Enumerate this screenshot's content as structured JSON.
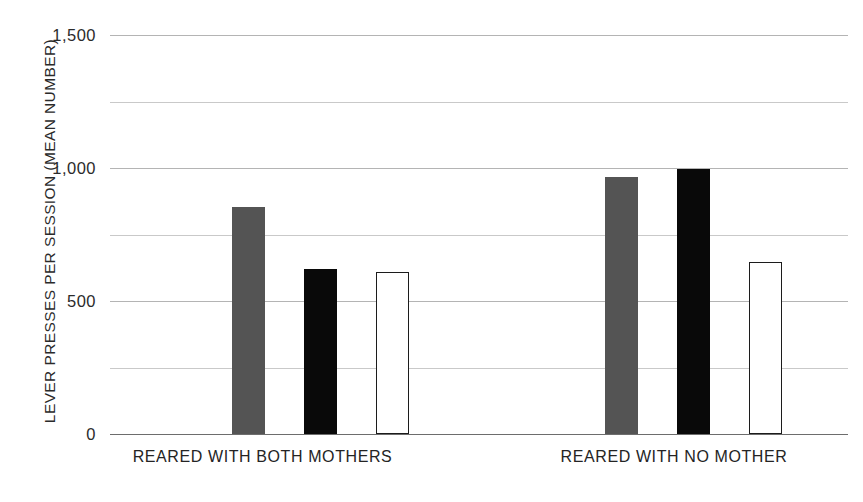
{
  "chart_data": {
    "type": "bar",
    "title": "",
    "xlabel": "",
    "ylabel": "LEVER PRESSES PER SESSION (MEAN NUMBER)",
    "ylim": [
      0,
      1500
    ],
    "yticks": [
      0,
      500,
      1000,
      1500
    ],
    "ytick_labels": [
      "0",
      "500",
      "1,000",
      "1,500"
    ],
    "gridlines": [
      0,
      250,
      500,
      750,
      1000,
      1250,
      1500
    ],
    "grid": true,
    "legend": "none",
    "categories": [
      "REARED WITH BOTH MOTHERS",
      "REARED WITH NO MOTHER"
    ],
    "series": [
      {
        "name": "hatched",
        "style": "hatched",
        "values": [
          880,
          1430
        ]
      },
      {
        "name": "gray",
        "style": "solid-gray",
        "values": [
          855,
          965
        ]
      },
      {
        "name": "black",
        "style": "solid-black",
        "values": [
          620,
          995
        ]
      },
      {
        "name": "white",
        "style": "outline",
        "values": [
          608,
          645
        ]
      }
    ],
    "colors": {
      "gray": "#545454",
      "black": "#090909",
      "outline_stroke": "#1c1c1c",
      "hatch_stroke": "#8e8e8e",
      "gridline": "#c9c9c9",
      "baseline": "#6d6d6d",
      "text": "#242424",
      "background": "#ffffff"
    }
  },
  "axis": {
    "y_title": "LEVER PRESSES PER SESSION (MEAN NUMBER)",
    "ticks": [
      {
        "value": 1500,
        "label": "1,500"
      },
      {
        "value": 1000,
        "label": "1,000"
      },
      {
        "value": 500,
        "label": "500"
      },
      {
        "value": 0,
        "label": "0"
      }
    ]
  },
  "groups": [
    {
      "label": "REARED WITH BOTH MOTHERS"
    },
    {
      "label": "REARED WITH NO MOTHER"
    }
  ]
}
